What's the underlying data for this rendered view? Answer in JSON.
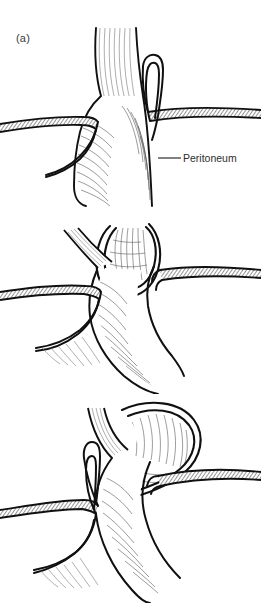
{
  "figure": {
    "background_color": "#ffffff",
    "ink_color": "#111111",
    "hatch_color": "#4a4a4a",
    "text_color": "#2e2e2e",
    "width": 261,
    "height": 603,
    "style": "black-and-white line drawing with pen hatching"
  },
  "panels": [
    {
      "id": "a",
      "label": "(a)",
      "description": "Normal anatomy: esophagus passing through the diaphragmatic hiatus into the stomach, peritoneum reflected on both sides"
    },
    {
      "id": "b",
      "label": "(b)",
      "description": "Sliding hiatal hernia: gastroesophageal junction and cardia displaced upward through the hiatus within a peritoneal sac"
    },
    {
      "id": "c",
      "label": "(c)",
      "description": "Paraesophageal hernia: gastric fundus rolls up alongside the esophagus through the hiatus"
    }
  ],
  "annotations": [
    {
      "id": "peritoneum",
      "text": "Peritoneum",
      "leader_from_x": 158,
      "leader_to_x": 181,
      "leader_y": 158,
      "panel": "a"
    }
  ],
  "anatomy_legend": {
    "esophagus": "vertical tube with fine longitudinal striations",
    "stomach": "curved viscus with dense oblique wall hatching",
    "peritoneum": "cross-hatched band bounded by two heavy outlines",
    "hernia_sac": "double-outlined membrane enclosing herniated stomach"
  }
}
